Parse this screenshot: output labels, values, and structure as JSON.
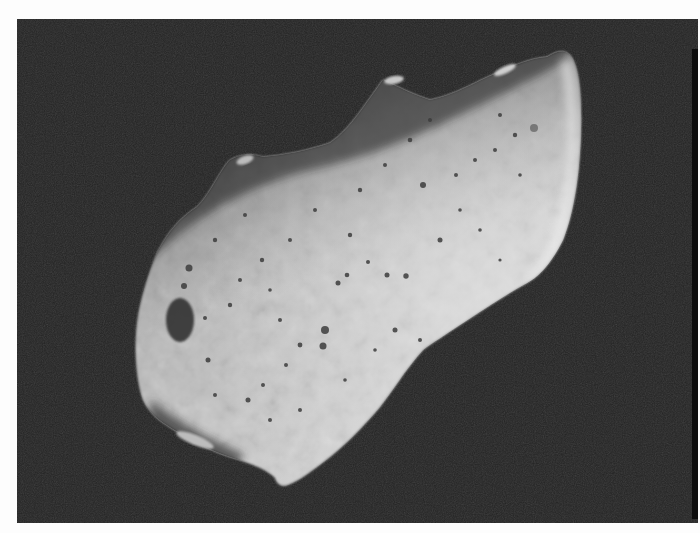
{
  "image": {
    "subject": "asteroid",
    "description": "Black-and-white spacecraft photograph of an elongated, heavily cratered asteroid against a dark background",
    "background_color": "#232323",
    "border_color": "#fdfdfd",
    "surface_color": "#c9c9c9",
    "shadow_color": "#3a3a3a"
  }
}
